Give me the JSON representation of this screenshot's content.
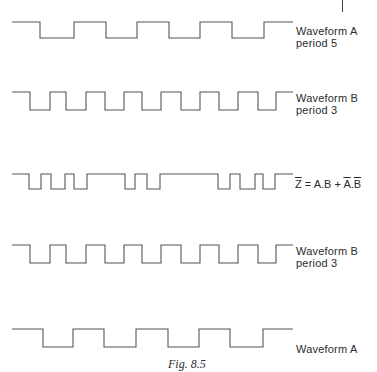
{
  "figure": {
    "caption": "Fig. 8.5",
    "line_color": "#555555",
    "waveforms": [
      {
        "id": "waveform-a-top",
        "label_line1": "Waveform A",
        "label_line2": "period 5",
        "high_y": 22,
        "low_y": 38,
        "start_x": 12,
        "end_x": 293,
        "start_level": "high",
        "edges_x": [
          40,
          74,
          106,
          137,
          169,
          200,
          232,
          264
        ]
      },
      {
        "id": "waveform-b-1",
        "label_line1": "Waveform B",
        "label_line2": "period 3",
        "high_y": 92,
        "low_y": 110,
        "start_x": 12,
        "end_x": 293,
        "start_level": "high",
        "edges_x": [
          30,
          50,
          66,
          86,
          105,
          124,
          142,
          161,
          181,
          200,
          219,
          238,
          258,
          276
        ]
      },
      {
        "id": "waveform-z",
        "label": "Z = A.B + A.B",
        "formula": {
          "lhs": "Z",
          "equals": "=",
          "term1": "A.B",
          "plus": "+",
          "term2_a": "A",
          "dot": ".",
          "term2_b": "B"
        },
        "high_y": 174,
        "low_y": 189,
        "start_x": 12,
        "end_x": 293,
        "start_level": "high",
        "edges_x": [
          29,
          41,
          51,
          65,
          74,
          87,
          125,
          135,
          147,
          160,
          218,
          230,
          240,
          255,
          263,
          275
        ]
      },
      {
        "id": "waveform-b-2",
        "label_line1": "Waveform B",
        "label_line2": "period 3",
        "high_y": 245,
        "low_y": 263,
        "start_x": 12,
        "end_x": 293,
        "start_level": "high",
        "edges_x": [
          30,
          50,
          66,
          86,
          105,
          124,
          142,
          161,
          181,
          200,
          219,
          238,
          258,
          276
        ]
      },
      {
        "id": "waveform-a-bottom",
        "label_line1": "Waveform A",
        "high_y": 329,
        "low_y": 347,
        "start_x": 12,
        "end_x": 293,
        "start_level": "high",
        "edges_x": [
          43,
          73,
          104,
          136,
          168,
          199,
          230,
          263
        ]
      }
    ]
  }
}
